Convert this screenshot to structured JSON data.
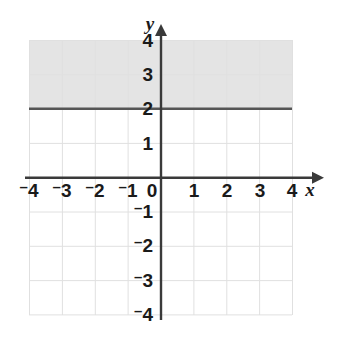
{
  "chart_data": {
    "type": "line",
    "title": "",
    "xlabel": "x",
    "ylabel": "y",
    "xlim": [
      -4,
      4
    ],
    "ylim": [
      -4,
      4
    ],
    "grid": true,
    "legend": "none",
    "x_ticks": [
      "-4",
      "-3",
      "-2",
      "-1",
      "0",
      "1",
      "2",
      "3",
      "4"
    ],
    "y_ticks": [
      "4",
      "3",
      "2",
      "1",
      "-1",
      "-2",
      "-3",
      "-4"
    ],
    "x_tick_values": [
      -4,
      -3,
      -2,
      -1,
      0,
      1,
      2,
      3,
      4
    ],
    "y_tick_values": [
      4,
      3,
      2,
      1,
      -1,
      -2,
      -3,
      -4
    ],
    "series": [
      {
        "name": "y = 2",
        "type": "horizontal-line",
        "style": "solid",
        "value": 2,
        "x": [
          -4,
          4
        ],
        "values": [
          2,
          2
        ],
        "color": "#555555"
      }
    ],
    "shaded_region": {
      "name": "y >= 2",
      "inequality": "y ≥ 2",
      "x_range": [
        -4,
        4
      ],
      "y_range": [
        2,
        4
      ],
      "color": "#e4e4e4"
    },
    "annotations": []
  },
  "axes": {
    "x_label": "x",
    "y_label": "y",
    "x_ticks": [
      {
        "label": "4",
        "negative": true,
        "value": -4
      },
      {
        "label": "3",
        "negative": true,
        "value": -3
      },
      {
        "label": "2",
        "negative": true,
        "value": -2
      },
      {
        "label": "1",
        "negative": true,
        "value": -1
      },
      {
        "label": "0",
        "negative": false,
        "value": 0
      },
      {
        "label": "1",
        "negative": false,
        "value": 1
      },
      {
        "label": "2",
        "negative": false,
        "value": 2
      },
      {
        "label": "3",
        "negative": false,
        "value": 3
      },
      {
        "label": "4",
        "negative": false,
        "value": 4
      }
    ],
    "y_ticks": [
      {
        "label": "4",
        "negative": false,
        "value": 4
      },
      {
        "label": "3",
        "negative": false,
        "value": 3
      },
      {
        "label": "2",
        "negative": false,
        "value": 2
      },
      {
        "label": "1",
        "negative": false,
        "value": 1
      },
      {
        "label": "1",
        "negative": true,
        "value": -1
      },
      {
        "label": "2",
        "negative": true,
        "value": -2
      },
      {
        "label": "3",
        "negative": true,
        "value": -3
      },
      {
        "label": "4",
        "negative": true,
        "value": -4
      }
    ]
  },
  "colors": {
    "grid": "#e0e0e0",
    "axis": "#3a3a3a",
    "boundary_line": "#555555",
    "shading": "#e4e4e4",
    "text": "#1a1a1a",
    "background": "#ffffff"
  },
  "minus_glyph": "–"
}
